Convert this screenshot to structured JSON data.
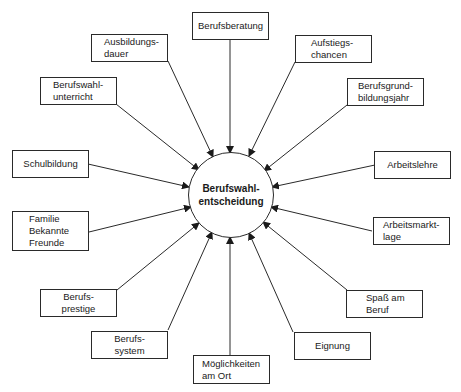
{
  "diagram": {
    "center": {
      "line1": "Berufswahl-",
      "line2": "entscheidung"
    },
    "nodes": [
      {
        "id": "berufsberatung",
        "lines": [
          "Berufsberatung"
        ]
      },
      {
        "id": "aufstiegschancen",
        "lines": [
          "Aufstiegs-",
          "chancen"
        ]
      },
      {
        "id": "berufsgrundbildungsjahr",
        "lines": [
          "Berufsgrund-",
          "bildungsjahr"
        ]
      },
      {
        "id": "arbeitslehre",
        "lines": [
          "Arbeitslehre"
        ]
      },
      {
        "id": "arbeitsmarktlage",
        "lines": [
          "Arbeitsmarkt-",
          "lage"
        ]
      },
      {
        "id": "spass-am-beruf",
        "lines": [
          "Spaß am",
          "Beruf"
        ]
      },
      {
        "id": "eignung",
        "lines": [
          "Eignung"
        ]
      },
      {
        "id": "moeglichkeiten-am-ort",
        "lines": [
          "Möglichkeiten",
          "am Ort"
        ]
      },
      {
        "id": "berufssystem",
        "lines": [
          "Berufs-",
          "system"
        ]
      },
      {
        "id": "berufsprestige",
        "lines": [
          "Berufs-",
          "prestige"
        ]
      },
      {
        "id": "familie",
        "lines": [
          "Familie",
          "Bekannte",
          "Freunde"
        ]
      },
      {
        "id": "schulbildung",
        "lines": [
          "Schulbildung"
        ]
      },
      {
        "id": "berufswahlunterricht",
        "lines": [
          "Berufswahl-",
          "unterricht"
        ]
      },
      {
        "id": "ausbildungsdauer",
        "lines": [
          "Ausbildungs-",
          "dauer"
        ]
      }
    ]
  }
}
